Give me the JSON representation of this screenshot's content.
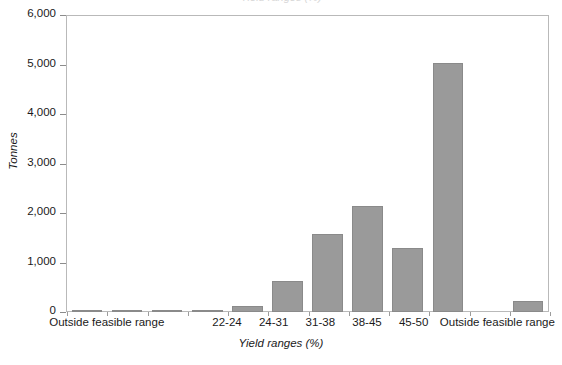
{
  "chart_data": {
    "type": "bar",
    "title": "",
    "xlabel": "Yield ranges (%)",
    "ylabel": "Tonnes",
    "ylim": [
      0,
      6000
    ],
    "ytick_labels": [
      "0",
      "1,000",
      "2,000",
      "3,000",
      "4,000",
      "5,000",
      "6,000"
    ],
    "ytick_values": [
      0,
      1000,
      2000,
      3000,
      4000,
      5000,
      6000
    ],
    "grid": false,
    "legend": false,
    "bar_color": "#9a9a9a",
    "bar_edge_color": "#8a8a8a",
    "categories": [
      "",
      "",
      "",
      "",
      "22-24",
      "24-31",
      "31-38",
      "38-45",
      "45-50",
      "",
      "",
      ""
    ],
    "values": [
      30,
      25,
      15,
      18,
      120,
      630,
      1575,
      2140,
      1290,
      5050,
      0,
      225
    ],
    "axis_group_labels": [
      {
        "label": "Outside feasible range",
        "center_pct": 19.0
      },
      {
        "label": "22-24",
        "center_pct": 40.4
      },
      {
        "label": "24-31",
        "center_pct": 48.7
      },
      {
        "label": "31-38",
        "center_pct": 57.0
      },
      {
        "label": "38-45",
        "center_pct": 65.3
      },
      {
        "label": "45-50",
        "center_pct": 73.6
      },
      {
        "label": "Outside feasible range",
        "center_pct": 88.5
      }
    ]
  },
  "axes": {
    "y_axis_title": "Tonnes",
    "x_axis_title": "Yield ranges (%)",
    "y_max_label": "6,000",
    "y_min_label": "0"
  },
  "title_sliver": {
    "text": "Yield ranges (%)"
  }
}
